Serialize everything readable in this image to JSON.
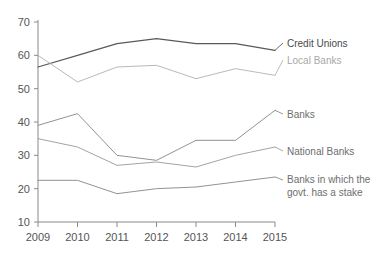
{
  "chart_data": {
    "type": "line",
    "title": "",
    "subtitle": "",
    "xlabel": "",
    "ylabel": "",
    "categories": [
      "2009",
      "2010",
      "2011",
      "2012",
      "2013",
      "2014",
      "2015"
    ],
    "x": [
      2009,
      2010,
      2011,
      2012,
      2013,
      2014,
      2015
    ],
    "xlim": [
      2009,
      2015
    ],
    "ylim": [
      10,
      70
    ],
    "yticks": [
      10,
      20,
      30,
      40,
      50,
      60,
      70
    ],
    "ytick_labels": [
      "10",
      "20",
      "30",
      "40",
      "50",
      "60",
      "70"
    ],
    "grid": false,
    "legend_position": "inline-right-annotations",
    "series": [
      {
        "name": "Credit Unions",
        "color": "#595959",
        "values": [
          56.5,
          60.0,
          63.5,
          65.0,
          63.5,
          63.5,
          61.5
        ]
      },
      {
        "name": "Local Banks",
        "color": "#b5b5b5",
        "values": [
          60.0,
          52.0,
          56.5,
          57.0,
          53.0,
          56.0,
          54.0
        ]
      },
      {
        "name": "Banks",
        "color": "#8c8c8c",
        "values": [
          39.0,
          42.5,
          30.0,
          28.5,
          34.5,
          34.5,
          43.5
        ]
      },
      {
        "name": "National Banks",
        "color": "#9e9e9e",
        "values": [
          35.0,
          32.5,
          27.0,
          28.0,
          26.5,
          30.0,
          32.5
        ]
      },
      {
        "name": "Banks in which the govt. has a stake",
        "color": "#8c8c8c",
        "values": [
          22.5,
          22.5,
          18.5,
          20.0,
          20.5,
          22.0,
          23.5
        ]
      }
    ],
    "annotations": [
      {
        "text": "Credit Unions",
        "series": "Credit Unions"
      },
      {
        "text": "Local Banks",
        "series": "Local Banks"
      },
      {
        "text": "Banks",
        "series": "Banks"
      },
      {
        "text": "National Banks",
        "series": "National Banks"
      },
      {
        "text_line1": "Banks in which the",
        "text_line2": "govt. has a stake",
        "series": "Banks in which the govt. has a stake"
      }
    ]
  },
  "axis": {
    "y_ticks": [
      "70",
      "60",
      "50",
      "40",
      "30",
      "20",
      "10"
    ],
    "x_ticks": [
      "2009",
      "2010",
      "2011",
      "2012",
      "2013",
      "2014",
      "2015"
    ]
  },
  "labels": {
    "credit_unions": "Credit Unions",
    "local_banks": "Local Banks",
    "banks": "Banks",
    "national_banks": "National Banks",
    "govt_stake_line1": "Banks in which the",
    "govt_stake_line2": "govt. has a stake"
  },
  "colors": {
    "background": "#ffffff",
    "axis": "#8a8a8a",
    "tick_text": "#555555",
    "credit_unions": "#595959",
    "local_banks": "#b5b5b5",
    "banks": "#8c8c8c",
    "national_banks": "#9e9e9e",
    "govt_stake": "#8c8c8c"
  }
}
